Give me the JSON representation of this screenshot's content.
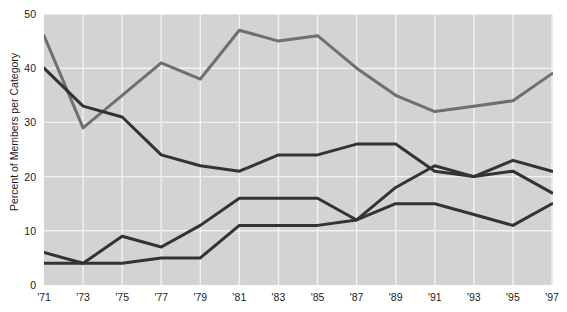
{
  "title_remnant": "",
  "axes": {
    "ylabel": "Percent of Members per Category",
    "yticks": [
      "0",
      "10",
      "20",
      "30",
      "40",
      "50"
    ],
    "xticks": [
      "'71",
      "'73",
      "'75",
      "'77",
      "'79",
      "'81",
      "'83",
      "'85",
      "'87",
      "'89",
      "'91",
      "'93",
      "'95",
      "'97"
    ]
  },
  "colors": {
    "plot_background": "#d3d3d3",
    "gridline": "#f2f2f2",
    "series_light": "#6f6f6f",
    "series_dark": "#333333",
    "text": "#1c1c1c"
  },
  "chart_data": {
    "type": "line",
    "title": "",
    "xlabel": "",
    "ylabel": "Percent of Members per Category",
    "x": [
      "'71",
      "'73",
      "'75",
      "'77",
      "'79",
      "'81",
      "'83",
      "'85",
      "'87",
      "'89",
      "'91",
      "'93",
      "'95",
      "'97"
    ],
    "xlim": [
      "'71",
      "'97"
    ],
    "ylim": [
      0,
      50
    ],
    "yticks": [
      0,
      10,
      20,
      30,
      40,
      50
    ],
    "grid": true,
    "legend": "none",
    "series": [
      {
        "name": "series-1",
        "color": "#6f6f6f",
        "values": [
          46,
          29,
          35,
          41,
          38,
          47,
          45,
          46,
          40,
          35,
          32,
          33,
          34,
          39
        ]
      },
      {
        "name": "series-2",
        "color": "#333333",
        "values": [
          40,
          33,
          31,
          24,
          22,
          21,
          24,
          24,
          26,
          26,
          21,
          20,
          21,
          17
        ]
      },
      {
        "name": "series-3",
        "color": "#333333",
        "values": [
          6,
          4,
          9,
          7,
          11,
          16,
          16,
          16,
          12,
          15,
          15,
          13,
          11,
          15
        ]
      },
      {
        "name": "series-4",
        "color": "#333333",
        "values": [
          4,
          4,
          4,
          5,
          5,
          11,
          11,
          11,
          12,
          18,
          22,
          20,
          23,
          21
        ]
      }
    ]
  }
}
